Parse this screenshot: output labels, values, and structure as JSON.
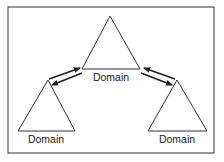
{
  "diagram": {
    "colors": {
      "stroke": "#333333",
      "frame": "#555555",
      "background": "#ffffff"
    },
    "nodes": [
      {
        "id": "top",
        "label": "Domain"
      },
      {
        "id": "left",
        "label": "Domain"
      },
      {
        "id": "right",
        "label": "Domain"
      }
    ],
    "edges": [
      {
        "from": "left",
        "to": "top",
        "type": "bidirectional-trust"
      },
      {
        "from": "top",
        "to": "right",
        "type": "bidirectional-trust"
      }
    ]
  }
}
